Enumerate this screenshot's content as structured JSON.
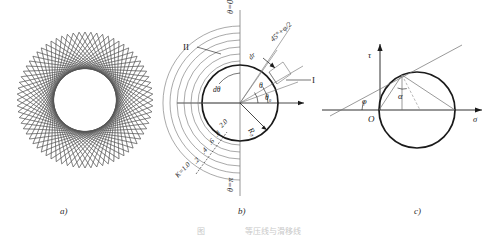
{
  "figure": {
    "caption": "图　　　　　等压线与滑移线",
    "panels": [
      {
        "id": "a",
        "label": "a)"
      },
      {
        "id": "b",
        "label": "b)"
      },
      {
        "id": "c",
        "label": "c)"
      }
    ]
  },
  "panel_a": {
    "name": "spirograph-envelope",
    "description": "annulus formed by envelope of chords",
    "outer_radius": 68,
    "inner_radius": 32,
    "chord_count": 72,
    "stroke": "#555555"
  },
  "panel_b": {
    "name": "slip-line-field-polar",
    "axis_top_label": "θ=0°",
    "axis_bottom_label": "θ=π",
    "region_label_2": "II",
    "region_label_1": "I",
    "radius_label": "R₀",
    "angle_dtheta": "dθ",
    "angle_theta": "θ",
    "angle_theta0": "θ₀",
    "increment_label": "dr",
    "ray_label": "45°+φ/2",
    "k_labels": [
      "K=1.0",
      ".2",
      ".4",
      ".6",
      ".8",
      "2.0"
    ],
    "k_values": [
      1.0,
      1.2,
      1.4,
      1.6,
      1.8,
      2.0
    ],
    "circle_radius": 38,
    "stroke": "#1a1a1a"
  },
  "panel_c": {
    "name": "mohr-circle",
    "axis_x_label": "σ",
    "axis_y_label": "τ",
    "origin_label": "O",
    "angle_phi": "φ",
    "angle_alpha": "α",
    "circle_radius": 38,
    "stroke": "#1a1a1a"
  },
  "colors": {
    "ink": "#1a1a1a",
    "light_ink": "#555555",
    "caption": "#c9c9c9"
  }
}
